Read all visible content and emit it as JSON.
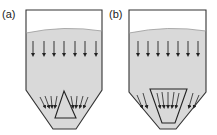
{
  "panels": [
    {
      "label": "(a)",
      "insert": "cone"
    },
    {
      "label": "(b)",
      "insert": "inverted-cone"
    }
  ],
  "colors": {
    "powder": "#d9d9d9",
    "stroke": "#333333",
    "empty": "#ffffff"
  }
}
